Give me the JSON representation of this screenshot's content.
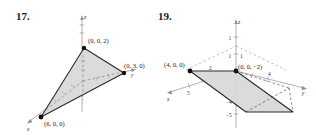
{
  "figures": [
    {
      "number": "17.",
      "points": [
        {
          "label": "(0, 0, 2)"
        },
        {
          "label": "(0, 3, 0)"
        },
        {
          "label": "(6, 0, 0)"
        }
      ],
      "axis_labels": {
        "x": "x",
        "y": "y",
        "z": "z"
      },
      "shape": "triangle",
      "fill_color": "#d7d7d7",
      "edge_color": "#2b2b2b",
      "axis_color": "#8c8c8c"
    },
    {
      "number": "19.",
      "points": [
        {
          "label": "(4, 0, 0)"
        },
        {
          "label": "(0, 0, −2)"
        }
      ],
      "axis_labels": {
        "x": "x",
        "y": "y",
        "z": "z"
      },
      "ticks": {
        "x": [
          "5",
          "2"
        ],
        "y": [
          "4"
        ],
        "z_positive": [
          "1"
        ],
        "z_negative": [
          "−3",
          "−4",
          "−5"
        ],
        "near_origin": [
          "1",
          "1"
        ]
      },
      "shape": "parallelogram",
      "fill_color": "#d7d7d7",
      "edge_color": "#2b2b2b",
      "axis_color": "#8c8c8c"
    }
  ]
}
